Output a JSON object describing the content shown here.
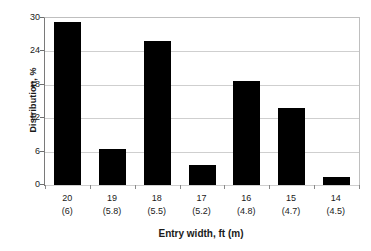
{
  "chart_data": {
    "type": "bar",
    "title": "",
    "xlabel": "Entry width, ft (m)",
    "ylabel": "Distribution, %",
    "categories": [
      "20\n(6)",
      "19\n(5.8)",
      "18\n(5.5)",
      "17\n(5.2)",
      "16\n(4.8)",
      "15\n(4.7)",
      "14\n(4.5)"
    ],
    "category_labels": [
      {
        "ft": "20",
        "m": "(6)"
      },
      {
        "ft": "19",
        "m": "(5.8)"
      },
      {
        "ft": "18",
        "m": "(5.5)"
      },
      {
        "ft": "17",
        "m": "(5.2)"
      },
      {
        "ft": "16",
        "m": "(4.8)"
      },
      {
        "ft": "15",
        "m": "(4.7)"
      },
      {
        "ft": "14",
        "m": "(4.5)"
      }
    ],
    "values": [
      29.3,
      6.5,
      25.8,
      3.6,
      18.7,
      13.8,
      1.5
    ],
    "ylim": [
      0,
      30
    ],
    "yticks": [
      "0",
      "6",
      "12",
      "18",
      "24",
      "30"
    ],
    "ytick_values": [
      0,
      6,
      12,
      18,
      24,
      30
    ],
    "grid": "horizontal",
    "legend": "none",
    "bar_color": "#000000",
    "gridline_color": "#cfcfcf",
    "axis_color": "#6e6e6e",
    "background": "#ffffff"
  }
}
